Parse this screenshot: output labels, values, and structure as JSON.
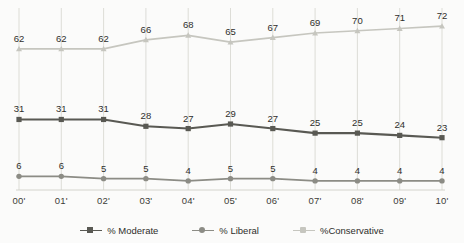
{
  "chart_data": {
    "type": "line",
    "title": "",
    "subtitle": "",
    "xlabel": "",
    "ylabel": "",
    "categories": [
      "00'",
      "01'",
      "02'",
      "03'",
      "04'",
      "05'",
      "06'",
      "07'",
      "08'",
      "09'",
      "10'"
    ],
    "ylim": [
      0,
      80
    ],
    "grid": "vertical-only",
    "legend_position": "bottom",
    "show_data_labels": true,
    "series": [
      {
        "name": "% Moderate",
        "values": [
          31,
          31,
          31,
          28,
          27,
          29,
          27,
          25,
          25,
          24,
          23
        ],
        "color": "#595953",
        "marker": "square"
      },
      {
        "name": "% Liberal",
        "values": [
          6,
          6,
          5,
          5,
          4,
          5,
          5,
          4,
          4,
          4,
          4
        ],
        "color": "#8c8c85",
        "marker": "circle"
      },
      {
        "name": "%Conservative",
        "values": [
          62,
          62,
          62,
          66,
          68,
          65,
          67,
          69,
          70,
          71,
          72
        ],
        "color": "#c6c6bf",
        "marker": "triangle"
      }
    ],
    "colors": {
      "moderate": "#595953",
      "liberal": "#8c8c85",
      "conservative": "#c6c6bf",
      "gridline": "#d9d9d2",
      "axis": "#cfcfc8",
      "background": "#fbfbfa",
      "label_text": "#2e2e2b"
    }
  }
}
